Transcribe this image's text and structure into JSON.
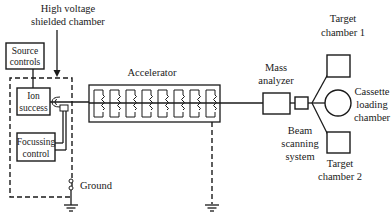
{
  "diagram": {
    "title_line1": "High voltage",
    "title_line2": "shielded chamber",
    "source_controls": {
      "line1": "Source",
      "line2": "controls"
    },
    "ion_source": {
      "line1": "Ion",
      "line2": "success"
    },
    "focussing_control": {
      "line1": "Focussing",
      "line2": "control"
    },
    "ground_label": "Ground",
    "accelerator_label": "Accelerator",
    "mass_analyzer": {
      "line1": "Mass",
      "line2": "analyzer"
    },
    "beam_scanning": {
      "line1": "Beam",
      "line2": "scanning",
      "line3": "system"
    },
    "target_chamber_1": {
      "line1": "Target",
      "line2": "chamber 1"
    },
    "cassette_loading": {
      "line1": "Cassette",
      "line2": "loading",
      "line3": "chamber"
    },
    "target_chamber_2": {
      "line1": "Target",
      "line2": "chamber 2"
    },
    "accelerator_stages": 8,
    "line_color": "#1a1a1a",
    "background_color": "#ffffff"
  }
}
